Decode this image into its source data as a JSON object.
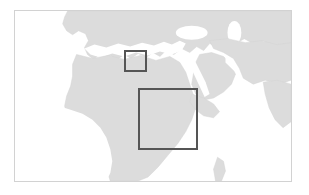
{
  "figure": {
    "kind": "reference-map",
    "caption": "",
    "width_px": 309,
    "height_px": 195
  },
  "colors": {
    "background": "#ffffff",
    "frame_border": "#d2d2d2",
    "ocean": "#ffffff",
    "land": "#dcdcdc",
    "land_edge": "#d4d4d4",
    "roi_stroke": "#555555"
  },
  "map": {
    "name": "africa-europe-middle-east-basemap",
    "projection_note": "equirectangular",
    "frame": {
      "left": 14,
      "top": 10,
      "width": 278,
      "height": 172
    },
    "landmasses": [
      {
        "name": "europe",
        "label": "Europe"
      },
      {
        "name": "africa",
        "label": "Africa"
      },
      {
        "name": "arabian-peninsula",
        "label": "Arabian Peninsula"
      },
      {
        "name": "middle-east",
        "label": "Middle East"
      },
      {
        "name": "south-asia-tip",
        "label": "South Asia"
      },
      {
        "name": "madagascar",
        "label": "Madagascar"
      }
    ],
    "water_bodies": [
      {
        "name": "atlantic-ocean",
        "label": "Atlantic Ocean"
      },
      {
        "name": "mediterranean-sea",
        "label": "Mediterranean Sea"
      },
      {
        "name": "red-sea",
        "label": "Red Sea"
      },
      {
        "name": "persian-gulf",
        "label": "Persian Gulf"
      },
      {
        "name": "indian-ocean",
        "label": "Indian Ocean"
      },
      {
        "name": "black-sea",
        "label": "Black Sea"
      },
      {
        "name": "caspian-sea",
        "label": "Caspian Sea"
      }
    ]
  },
  "regions_of_interest": [
    {
      "id": "roi-small",
      "name": "eastern-mediterranean-box",
      "label": "",
      "left": 109,
      "top": 39,
      "width": 23,
      "height": 22,
      "stroke_width": 2
    },
    {
      "id": "roi-large",
      "name": "northeast-africa-box",
      "label": "",
      "left": 123,
      "top": 77,
      "width": 60,
      "height": 62,
      "stroke_width": 2
    }
  ]
}
